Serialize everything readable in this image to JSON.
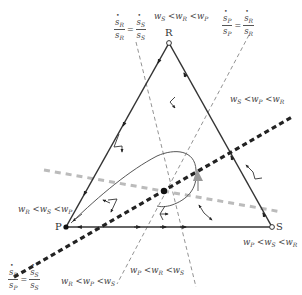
{
  "diagram": {
    "type": "simplex-phase-portrait",
    "vertices": {
      "R": {
        "label": "R",
        "x": 169,
        "y": 43
      },
      "P": {
        "label": "P",
        "x": 66,
        "y": 227
      },
      "S": {
        "label": "S",
        "x": 272,
        "y": 227
      }
    },
    "region_labels": {
      "top": {
        "w1": "w",
        "s1": "S",
        "w2": "w",
        "s2": "R",
        "w3": "w",
        "s3": "P"
      },
      "right": {
        "w1": "w",
        "s1": "S",
        "w2": "w",
        "s2": "P",
        "w3": "w",
        "s3": "R"
      },
      "left": {
        "w1": "w",
        "s1": "R",
        "w2": "w",
        "s2": "S",
        "w3": "w",
        "s3": "P"
      },
      "bottom_left": {
        "w1": "w",
        "s1": "R",
        "w2": "w",
        "s2": "P",
        "w3": "w",
        "s3": "S"
      },
      "bottom": {
        "w1": "w",
        "s1": "P",
        "w2": "w",
        "s2": "R",
        "w3": "w",
        "s3": "S"
      },
      "bottom_right": {
        "w1": "w",
        "s1": "P",
        "w2": "w",
        "s2": "S",
        "w3": "w",
        "s3": "R"
      }
    },
    "region_texts": {
      "top": "wS < wR < wP",
      "right": "wS < wP < wR",
      "left": "wR < wS < wP",
      "bottom_left": "wR < wP < wS",
      "bottom": "wP < wR < wS",
      "bottom_right": "wP < wS < wR"
    },
    "isoclines": {
      "RS": {
        "lhs_num": "s",
        "lhs_num_sub": "R",
        "lhs_den": "s",
        "lhs_den_sub": "R",
        "eq": "=",
        "rhs_num": "s",
        "rhs_num_sub": "S",
        "rhs_den": "s",
        "rhs_den_sub": "S"
      },
      "PR": {
        "lhs_num": "s",
        "lhs_num_sub": "P",
        "lhs_den": "s",
        "lhs_den_sub": "P",
        "eq": "=",
        "rhs_num": "s",
        "rhs_num_sub": "R",
        "rhs_den": "s",
        "rhs_den_sub": "R"
      },
      "PS": {
        "lhs_num": "s",
        "lhs_num_sub": "P",
        "lhs_den": "s",
        "lhs_den_sub": "P",
        "eq": "=",
        "rhs_num": "s",
        "rhs_num_sub": "S",
        "rhs_den": "s",
        "rhs_den_sub": "S"
      }
    },
    "lt": "<",
    "colors": {
      "edge": "#333333",
      "dashed": "#777777",
      "heavy_dotted": "#222222",
      "grey_dashed": "#bbbbbb",
      "accent_arrow": "#999999"
    }
  }
}
